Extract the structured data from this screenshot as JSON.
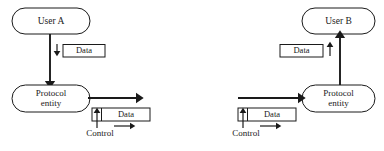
{
  "diagram": {
    "colors": {
      "stroke": "#1a1a1a",
      "fill": "#ffffff",
      "background": "#ffffff"
    },
    "left": {
      "user_node": "User A",
      "entity_node_line1": "Protocol",
      "entity_node_line2": "entity",
      "data_label": "Data",
      "pdu_data_label": "Data",
      "control_label": "Control"
    },
    "right": {
      "user_node": "User B",
      "entity_node_line1": "Protocol",
      "entity_node_line2": "entity",
      "data_label": "Data",
      "pdu_data_label": "Data",
      "control_label": "Control"
    }
  }
}
